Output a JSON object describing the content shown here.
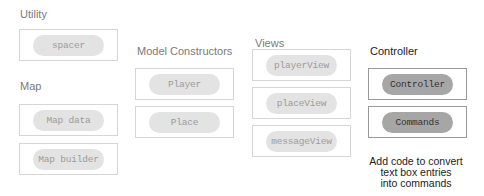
{
  "groups": {
    "utility": {
      "label": "Utility",
      "modules": [
        "spacer"
      ]
    },
    "map": {
      "label": "Map",
      "modules": [
        "Map data",
        "Map builder"
      ]
    },
    "model_constructors": {
      "label": "Model Constructors",
      "modules": [
        "Player",
        "Place"
      ]
    },
    "views": {
      "label": "Views",
      "modules": [
        "playerView",
        "placeView",
        "messageView"
      ]
    },
    "controller": {
      "label": "Controller",
      "modules": [
        "Controller",
        "Commands"
      ],
      "caption_lines": [
        "Add code to convert",
        "text box entries",
        "into commands"
      ]
    }
  },
  "colors": {
    "pill_light": "#e3e3e3",
    "pill_dark": "#a6a6a6",
    "box_border_light": "#d6d6d6",
    "box_border_dark": "#9a9a9a",
    "label_muted": "#7a7a7a",
    "label_dark": "#222222"
  }
}
